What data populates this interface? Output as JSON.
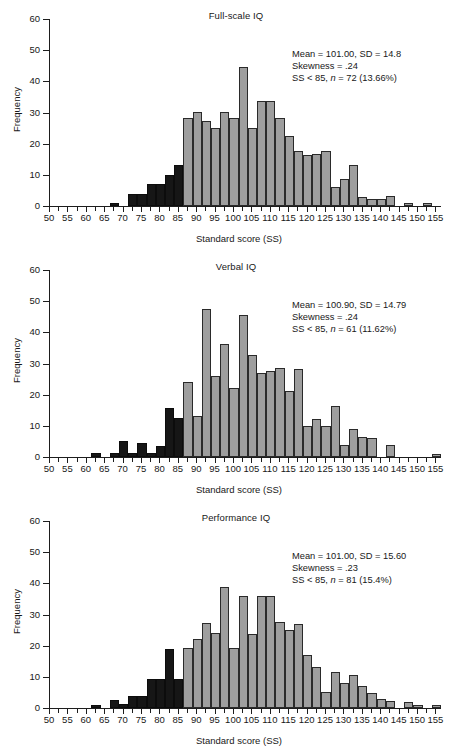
{
  "figure": {
    "panel_count": 3
  },
  "axes": {
    "ylabel": "Frequency",
    "xlabel": "Standard score (SS)",
    "yticks": [
      0,
      10,
      20,
      30,
      40,
      50,
      60
    ],
    "xticks": [
      50,
      55,
      60,
      65,
      70,
      75,
      80,
      85,
      90,
      95,
      100,
      105,
      110,
      115,
      120,
      125,
      130,
      135,
      140,
      145,
      150,
      155
    ],
    "ylim": [
      0,
      60
    ],
    "xlim": [
      50,
      156.5
    ],
    "bin_width": 2.5,
    "grid": false
  },
  "colors": {
    "bar_normal": "#9e9e9e",
    "bar_below85": "#161616",
    "axis": "#1d1d1d",
    "text": "#181818",
    "background": "#ffffff"
  },
  "chart_data": [
    {
      "type": "bar",
      "id": "full-scale-iq",
      "title": "Full-scale IQ",
      "xlabel": "Standard score (SS)",
      "ylabel": "Frequency",
      "ylim": [
        0,
        60
      ],
      "xlim": [
        50,
        156.5
      ],
      "bin_width": 2.5,
      "grid": false,
      "legend": "none",
      "annotations": {
        "mean_sd": "Mean = 101.00, SD = 14.8",
        "skewness": "Skewness = .24",
        "below85_pre": "SS < 85, ",
        "below85_n": "n",
        "below85_post": " = 72 (13.66%)"
      },
      "stats": {
        "mean": 101.0,
        "sd": 14.8,
        "skewness": 0.24,
        "n_below_85": 72,
        "pct_below_85": 13.66
      },
      "bins": [
        {
          "x": 66.5,
          "value": 1,
          "shaded": true
        },
        {
          "x": 69.0,
          "value": 0,
          "shaded": true
        },
        {
          "x": 71.5,
          "value": 4,
          "shaded": true
        },
        {
          "x": 74.0,
          "value": 4,
          "shaded": true
        },
        {
          "x": 76.5,
          "value": 7,
          "shaded": true
        },
        {
          "x": 79.0,
          "value": 7,
          "shaded": true
        },
        {
          "x": 81.5,
          "value": 10,
          "shaded": true
        },
        {
          "x": 84.0,
          "value": 13.2,
          "shaded": true
        },
        {
          "x": 86.5,
          "value": 28.4,
          "shaded": false
        },
        {
          "x": 89.0,
          "value": 30.2,
          "shaded": false
        },
        {
          "x": 91.5,
          "value": 27.3,
          "shaded": false
        },
        {
          "x": 94.0,
          "value": 25.1,
          "shaded": false
        },
        {
          "x": 96.5,
          "value": 30.2,
          "shaded": false
        },
        {
          "x": 99.0,
          "value": 28.4,
          "shaded": false
        },
        {
          "x": 101.5,
          "value": 44.5,
          "shaded": false
        },
        {
          "x": 104.0,
          "value": 25.1,
          "shaded": false
        },
        {
          "x": 106.5,
          "value": 33.8,
          "shaded": false
        },
        {
          "x": 109.0,
          "value": 33.8,
          "shaded": false
        },
        {
          "x": 111.5,
          "value": 28.4,
          "shaded": false
        },
        {
          "x": 114.0,
          "value": 22.4,
          "shaded": false
        },
        {
          "x": 116.5,
          "value": 17.5,
          "shaded": false
        },
        {
          "x": 119.0,
          "value": 16.5,
          "shaded": false
        },
        {
          "x": 121.5,
          "value": 16.6,
          "shaded": false
        },
        {
          "x": 124.0,
          "value": 17.5,
          "shaded": false
        },
        {
          "x": 126.5,
          "value": 6.2,
          "shaded": false
        },
        {
          "x": 129.0,
          "value": 8.8,
          "shaded": false
        },
        {
          "x": 131.5,
          "value": 13.3,
          "shaded": false
        },
        {
          "x": 134.0,
          "value": 3.0,
          "shaded": false
        },
        {
          "x": 136.5,
          "value": 2.1,
          "shaded": false
        },
        {
          "x": 139.0,
          "value": 2.1,
          "shaded": false
        },
        {
          "x": 141.5,
          "value": 3.3,
          "shaded": false
        },
        {
          "x": 146.5,
          "value": 1.1,
          "shaded": false
        },
        {
          "x": 151.5,
          "value": 1.1,
          "shaded": false
        }
      ]
    },
    {
      "type": "bar",
      "id": "verbal-iq",
      "title": "Verbal IQ",
      "xlabel": "Standard score (SS)",
      "ylabel": "Frequency",
      "ylim": [
        0,
        60
      ],
      "xlim": [
        50,
        156.5
      ],
      "bin_width": 2.5,
      "grid": false,
      "legend": "none",
      "annotations": {
        "mean_sd": "Mean = 100.90, SD = 14.79",
        "skewness": "Skewness = .24",
        "below85_pre": "SS < 85, ",
        "below85_n": "n",
        "below85_post": " = 61 (11.62%)"
      },
      "stats": {
        "mean": 100.9,
        "sd": 14.79,
        "skewness": 0.24,
        "n_below_85": 61,
        "pct_below_85": 11.62
      },
      "bins": [
        {
          "x": 61.5,
          "value": 1.2,
          "shaded": true
        },
        {
          "x": 66.5,
          "value": 1.2,
          "shaded": true
        },
        {
          "x": 69.0,
          "value": 5.0,
          "shaded": true
        },
        {
          "x": 71.5,
          "value": 1.2,
          "shaded": true
        },
        {
          "x": 74.0,
          "value": 4.5,
          "shaded": true
        },
        {
          "x": 76.5,
          "value": 1.2,
          "shaded": true
        },
        {
          "x": 79.0,
          "value": 3.6,
          "shaded": true
        },
        {
          "x": 81.5,
          "value": 15.6,
          "shaded": true
        },
        {
          "x": 84.0,
          "value": 12.5,
          "shaded": true
        },
        {
          "x": 86.5,
          "value": 24.1,
          "shaded": false
        },
        {
          "x": 89.0,
          "value": 13.3,
          "shaded": false
        },
        {
          "x": 91.5,
          "value": 47.5,
          "shaded": false
        },
        {
          "x": 94.0,
          "value": 26.1,
          "shaded": false
        },
        {
          "x": 96.5,
          "value": 36.2,
          "shaded": false
        },
        {
          "x": 99.0,
          "value": 22.1,
          "shaded": false
        },
        {
          "x": 101.5,
          "value": 45.6,
          "shaded": false
        },
        {
          "x": 104.0,
          "value": 32.8,
          "shaded": false
        },
        {
          "x": 106.5,
          "value": 27.1,
          "shaded": false
        },
        {
          "x": 109.0,
          "value": 27.7,
          "shaded": false
        },
        {
          "x": 111.5,
          "value": 28.7,
          "shaded": false
        },
        {
          "x": 114.0,
          "value": 21.3,
          "shaded": false
        },
        {
          "x": 116.5,
          "value": 28.1,
          "shaded": false
        },
        {
          "x": 119.0,
          "value": 10.1,
          "shaded": false
        },
        {
          "x": 121.5,
          "value": 12.3,
          "shaded": false
        },
        {
          "x": 124.0,
          "value": 9.9,
          "shaded": false
        },
        {
          "x": 126.5,
          "value": 16.3,
          "shaded": false
        },
        {
          "x": 129.0,
          "value": 3.9,
          "shaded": false
        },
        {
          "x": 131.5,
          "value": 9.0,
          "shaded": false
        },
        {
          "x": 134.0,
          "value": 6.5,
          "shaded": false
        },
        {
          "x": 136.5,
          "value": 6.2,
          "shaded": false
        },
        {
          "x": 141.5,
          "value": 3.9,
          "shaded": false
        },
        {
          "x": 154.0,
          "value": 1.1,
          "shaded": false
        }
      ]
    },
    {
      "type": "bar",
      "id": "performance-iq",
      "title": "Performance IQ",
      "xlabel": "Standard score (SS)",
      "ylabel": "Frequency",
      "ylim": [
        0,
        60
      ],
      "xlim": [
        50,
        156.5
      ],
      "bin_width": 2.5,
      "grid": false,
      "legend": "none",
      "annotations": {
        "mean_sd": "Mean = 101.00, SD = 15.60",
        "skewness": "Skewness = .23",
        "below85_pre": "SS < 85, ",
        "below85_n": "n",
        "below85_post": " = 81 (15.4%)"
      },
      "stats": {
        "mean": 101.0,
        "sd": 15.6,
        "skewness": 0.23,
        "n_below_85": 81,
        "pct_below_85": 15.4
      },
      "bins": [
        {
          "x": 61.5,
          "value": 1.0,
          "shaded": true
        },
        {
          "x": 66.5,
          "value": 2.5,
          "shaded": true
        },
        {
          "x": 69.0,
          "value": 1.2,
          "shaded": true
        },
        {
          "x": 71.5,
          "value": 3.7,
          "shaded": true
        },
        {
          "x": 74.0,
          "value": 3.7,
          "shaded": true
        },
        {
          "x": 76.5,
          "value": 9.2,
          "shaded": true
        },
        {
          "x": 79.0,
          "value": 9.2,
          "shaded": true
        },
        {
          "x": 81.5,
          "value": 19.0,
          "shaded": true
        },
        {
          "x": 84.0,
          "value": 9.3,
          "shaded": true
        },
        {
          "x": 86.5,
          "value": 19.1,
          "shaded": false
        },
        {
          "x": 89.0,
          "value": 22.0,
          "shaded": false
        },
        {
          "x": 91.5,
          "value": 27.3,
          "shaded": false
        },
        {
          "x": 94.0,
          "value": 24.0,
          "shaded": false
        },
        {
          "x": 96.5,
          "value": 38.9,
          "shaded": false
        },
        {
          "x": 99.0,
          "value": 19.1,
          "shaded": false
        },
        {
          "x": 101.5,
          "value": 36.0,
          "shaded": false
        },
        {
          "x": 104.0,
          "value": 23.6,
          "shaded": false
        },
        {
          "x": 106.5,
          "value": 36.0,
          "shaded": false
        },
        {
          "x": 109.0,
          "value": 36.0,
          "shaded": false
        },
        {
          "x": 111.5,
          "value": 27.5,
          "shaded": false
        },
        {
          "x": 114.0,
          "value": 24.9,
          "shaded": false
        },
        {
          "x": 116.5,
          "value": 27.1,
          "shaded": false
        },
        {
          "x": 119.0,
          "value": 16.9,
          "shaded": false
        },
        {
          "x": 121.5,
          "value": 13.3,
          "shaded": false
        },
        {
          "x": 124.0,
          "value": 5.0,
          "shaded": false
        },
        {
          "x": 126.5,
          "value": 11.7,
          "shaded": false
        },
        {
          "x": 129.0,
          "value": 8.0,
          "shaded": false
        },
        {
          "x": 131.5,
          "value": 10.5,
          "shaded": false
        },
        {
          "x": 134.0,
          "value": 7.0,
          "shaded": false
        },
        {
          "x": 136.5,
          "value": 4.9,
          "shaded": false
        },
        {
          "x": 139.0,
          "value": 3.0,
          "shaded": false
        },
        {
          "x": 141.5,
          "value": 2.2,
          "shaded": false
        },
        {
          "x": 146.5,
          "value": 1.9,
          "shaded": false
        },
        {
          "x": 149.0,
          "value": 1.0,
          "shaded": false
        },
        {
          "x": 154.0,
          "value": 1.1,
          "shaded": false
        }
      ]
    }
  ]
}
